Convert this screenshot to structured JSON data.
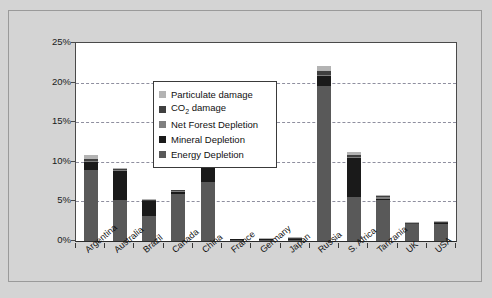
{
  "chart_data": {
    "type": "bar",
    "subtype": "stacked-bar",
    "title": "",
    "xlabel": "",
    "ylabel": "",
    "ylim": [
      0,
      25
    ],
    "ytick_labels": [
      "0%",
      "5%",
      "10%",
      "15%",
      "20%",
      "25%"
    ],
    "ytick_values": [
      0,
      5,
      10,
      15,
      20,
      25
    ],
    "grid": true,
    "grid_style": "dashed horizontal",
    "legend_position": "top-left inside plot",
    "categories": [
      "Argentina",
      "Australia",
      "Brazil",
      "Canada",
      "China",
      "France",
      "Germany",
      "Japan",
      "Russia",
      "S. Africa",
      "Tanzania",
      "UK",
      "USA"
    ],
    "series": [
      {
        "name": "Energy Depletion",
        "color": "#595959",
        "values": [
          9.0,
          5.2,
          3.2,
          5.9,
          7.4,
          0.05,
          0.1,
          0.1,
          19.6,
          5.6,
          5.2,
          2.1,
          2.2
        ]
      },
      {
        "name": "Mineral Depletion",
        "color": "#1a1a1a",
        "values": [
          1.0,
          3.7,
          1.8,
          0.3,
          2.0,
          0.05,
          0.05,
          0.05,
          1.3,
          4.9,
          0.1,
          0.1,
          0.1
        ]
      },
      {
        "name": "Net Forest Depletion",
        "color": "#7f7f7f",
        "values": [
          0.15,
          0.05,
          0.1,
          0.05,
          0.1,
          0.0,
          0.0,
          0.05,
          0.1,
          0.1,
          0.3,
          0.0,
          0.0
        ]
      },
      {
        "name": "CO2 damage",
        "color": "#404040",
        "values": [
          0.2,
          0.1,
          0.1,
          0.1,
          0.7,
          0.05,
          0.05,
          0.1,
          0.5,
          0.2,
          0.1,
          0.1,
          0.1
        ]
      },
      {
        "name": "Particulate damage",
        "color": "#b3b3b3",
        "values": [
          0.55,
          0.1,
          0.05,
          0.05,
          1.0,
          0.0,
          0.05,
          0.05,
          0.6,
          0.4,
          0.05,
          0.05,
          0.05
        ]
      }
    ],
    "totals": [
      10.9,
      9.15,
      5.25,
      6.4,
      11.2,
      0.15,
      0.25,
      0.35,
      22.1,
      11.2,
      5.75,
      2.35,
      2.45
    ]
  },
  "legend": {
    "items": [
      {
        "label": "Particulate damage",
        "color": "#b3b3b3",
        "has_sub": false
      },
      {
        "label": "CO",
        "sub": "2",
        "label_after": " damage",
        "color": "#404040",
        "has_sub": true
      },
      {
        "label": "Net Forest Depletion",
        "color": "#7f7f7f",
        "has_sub": false
      },
      {
        "label": "Mineral Depletion",
        "color": "#1a1a1a",
        "has_sub": false
      },
      {
        "label": "Energy Depletion",
        "color": "#595959",
        "has_sub": false
      }
    ]
  },
  "colors": {
    "page_background": "#d4d4d4",
    "plot_background": "#ffffff",
    "axis": "#3a3a3a",
    "gridline": "#8f8f9f",
    "text": "#111111"
  }
}
